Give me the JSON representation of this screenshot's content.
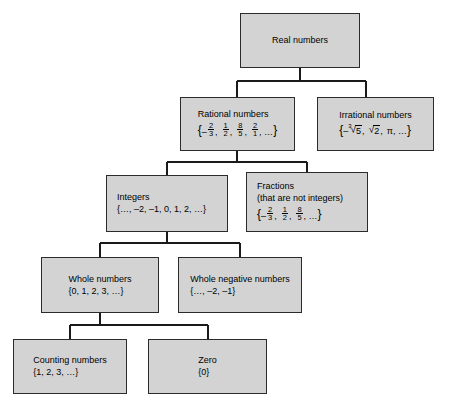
{
  "diagram": {
    "type": "tree-hierarchy",
    "box_fill": "#d3d3d3",
    "box_border": "#2b2b2b",
    "background": "#ffffff",
    "nodes": {
      "real": {
        "label": "Real numbers"
      },
      "rational": {
        "label": "Rational numbers",
        "set_open": "{",
        "set_close": "}",
        "sign": "–",
        "f1_num": "2",
        "f1_den": "3",
        "sep1": ",",
        "f2_num": "1",
        "f2_den": "2",
        "sep2": ",",
        "f3_num": "8",
        "f3_den": "5",
        "sep3": ",",
        "f4_num": "2",
        "f4_den": "1",
        "sep4": ", …"
      },
      "irrational": {
        "label": "Irrational numbers",
        "set_open": "{",
        "set_close": "}",
        "sign": "–",
        "cube_index": "3",
        "radical_glyph": "√",
        "cube_arg": "5",
        "sep1": ",",
        "sqrt_arg": "2",
        "sep2": ",",
        "pi": "π",
        "sep3": ", …"
      },
      "integers": {
        "label": "Integers",
        "set": "{…, –2, –1, 0, 1, 2, …}"
      },
      "fractions": {
        "label": "Fractions",
        "sublabel": "(that are not integers)",
        "set_open": "{",
        "set_close": "}",
        "sign": "–",
        "f1_num": "2",
        "f1_den": "3",
        "sep1": ",",
        "f2_num": "1",
        "f2_den": "2",
        "sep2": ",",
        "f3_num": "8",
        "f3_den": "5",
        "sep3": ", …"
      },
      "whole": {
        "label": "Whole numbers",
        "set": "{0, 1, 2, 3, …}"
      },
      "whole_negative": {
        "label": "Whole negative numbers",
        "set": "{…, –2, –1}"
      },
      "counting": {
        "label": "Counting numbers",
        "set": "{1, 2, 3, …}"
      },
      "zero": {
        "label": "Zero",
        "set": "{0}"
      }
    }
  }
}
